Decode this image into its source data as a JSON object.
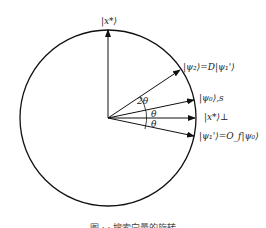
{
  "diagram": {
    "type": "grover-rotation-circle",
    "labels": {
      "top_axis": "|x*⟩",
      "psi_2": "|ψ₂⟩=D|ψ₁'⟩",
      "psi_0": "|ψ₀⟩,s",
      "x_perp": "|x*⟩⊥",
      "psi_1": "|ψ₁'⟩=O_f|ψ₀⟩"
    },
    "angles": {
      "two_theta": "2θ",
      "theta_upper": "θ",
      "theta_lower": "θ"
    },
    "caption": "图 ·  · 搜索向量的旋转"
  }
}
